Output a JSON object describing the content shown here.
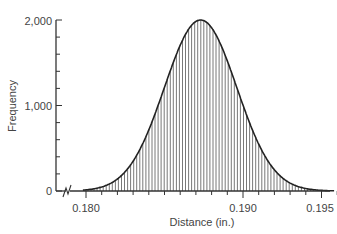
{
  "chart_data": {
    "type": "bar",
    "subtype": "histogram with smooth outline",
    "title": "",
    "xlabel": "Distance (in.)",
    "ylabel": "Frequency",
    "xlim": [
      0.1785,
      0.1962
    ],
    "ylim": [
      0,
      2000
    ],
    "x_ticks": [
      0.18,
      0.19,
      0.195
    ],
    "x_tick_labels": [
      "0.180",
      "0.190",
      "0.195"
    ],
    "x_minor_tick_step": 0.001,
    "y_ticks": [
      0,
      1000,
      2000
    ],
    "y_tick_labels": [
      "0",
      "1,000",
      "2,000"
    ],
    "y_minor_tick_step": 200,
    "axis_break_x": true,
    "grid": false,
    "legend": null,
    "x": [
      0.18,
      0.181,
      0.182,
      0.183,
      0.184,
      0.185,
      0.186,
      0.187,
      0.188,
      0.189,
      0.19,
      0.191,
      0.192,
      0.193,
      0.194,
      0.195
    ],
    "values": [
      13,
      47,
      142,
      348,
      719,
      1213,
      1697,
      1983,
      1911,
      1522,
      1007,
      547,
      250,
      92,
      29,
      7
    ],
    "distribution": {
      "shape": "normal",
      "mean": 0.1873,
      "std": 0.0023,
      "peak": 2000,
      "start": 0.1798,
      "end": 0.1958
    }
  },
  "labels": {
    "ylabel": "Frequency",
    "xlabel": "Distance (in.)",
    "y0": "0",
    "y1000": "1,000",
    "y2000": "2,000",
    "x180": "0.180",
    "x190": "0.190",
    "x195": "0.195"
  }
}
